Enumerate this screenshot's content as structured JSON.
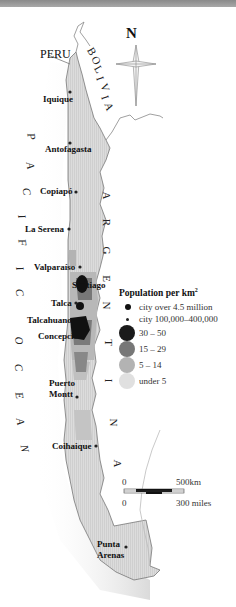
{
  "map": {
    "title_bar_color": "#999999",
    "countries": {
      "peru": "PERU",
      "bolivia_letters": [
        "B",
        "O",
        "L",
        "I",
        "V",
        "I",
        "A"
      ],
      "argentina_letters": [
        "A",
        "R",
        "G",
        "E",
        "N",
        "T",
        "I",
        "N",
        "A"
      ]
    },
    "ocean_letters": [
      "P",
      "A",
      "C",
      "I",
      "F",
      "I",
      "C",
      "O",
      "C",
      "E",
      "A",
      "N"
    ],
    "compass": {
      "label": "N"
    },
    "cities": [
      {
        "name": "Iquique",
        "x": 70,
        "y": 92
      },
      {
        "name": "Antofagasta",
        "x": 70,
        "y": 143
      },
      {
        "name": "Copiapó",
        "x": 76,
        "y": 192
      },
      {
        "name": "La Serena",
        "x": 69,
        "y": 230
      },
      {
        "name": "Valparaíso",
        "x": 80,
        "y": 268
      },
      {
        "name": "Santiago",
        "x": 81,
        "y": 285
      },
      {
        "name": "Talca",
        "x": 76,
        "y": 303
      },
      {
        "name": "Talcahuano",
        "x": 70,
        "y": 320
      },
      {
        "name": "Concepción",
        "x": 74,
        "y": 336
      },
      {
        "name": "Puerto Montt",
        "x": 77,
        "y": 393
      },
      {
        "name": "Coihaique",
        "x": 96,
        "y": 445
      },
      {
        "name": "Punta Arenas",
        "x": 126,
        "y": 545
      }
    ],
    "labels": {
      "iquique": "Iquique",
      "antofagasta": "Antofagasta",
      "copiapo": "Copiapó",
      "la_serena": "La Serena",
      "valparaiso": "Valparaíso",
      "santiago": "Santiago",
      "talca": "Talca",
      "talcahuano": "Talcahuano",
      "concepcion": "Concepción",
      "puerto": "Puerto",
      "montt": "Montt",
      "coihaique": "Coihaique",
      "punta": "Punta",
      "arenas": "Arenas"
    },
    "legend": {
      "title": "Population per km",
      "title_sup": "2",
      "items": [
        {
          "label": "city over 4.5 million",
          "symbol": "large-dot",
          "color": "#111111"
        },
        {
          "label": "city 100,000–400,000",
          "symbol": "small-dot",
          "color": "#222222"
        },
        {
          "label": "30 – 50",
          "symbol": "circle",
          "color": "#1a1a1a"
        },
        {
          "label": "15 – 29",
          "symbol": "circle",
          "color": "#777777"
        },
        {
          "label": "5 – 14",
          "symbol": "circle",
          "color": "#b3b3b3"
        },
        {
          "label": "under 5",
          "symbol": "circle",
          "color": "#e0e0e0"
        }
      ]
    },
    "scale": {
      "km_zero": "0",
      "km_label": "500km",
      "mi_zero": "0",
      "mi_label": "300 miles"
    }
  }
}
